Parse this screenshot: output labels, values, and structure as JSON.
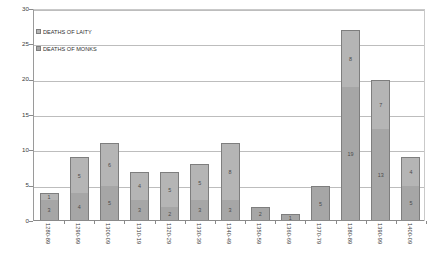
{
  "chart_data": {
    "type": "bar",
    "stacked": true,
    "title": "",
    "xlabel": "",
    "ylabel": "",
    "ylim": [
      0,
      30
    ],
    "ytick_step": 5,
    "yticks": [
      0,
      5,
      10,
      15,
      20,
      25,
      30
    ],
    "grid": true,
    "legend_position": "top-left",
    "categories": [
      "1280-89",
      "1290-99",
      "1300-09",
      "1310-19",
      "1320-29",
      "1330-39",
      "1340-49",
      "1350-59",
      "1360-69",
      "1370-79",
      "1380-89",
      "1390-99",
      "1400-09"
    ],
    "series": [
      {
        "name": "DEATHS OF MONKS",
        "color": "#a6a6a6",
        "values": [
          3,
          4,
          5,
          3,
          2,
          3,
          3,
          2,
          1,
          5,
          19,
          13,
          5
        ]
      },
      {
        "name": "DEATHS OF LAITY",
        "color": "#b5b5b5",
        "values": [
          1,
          5,
          6,
          4,
          5,
          5,
          8,
          0,
          0,
          0,
          8,
          7,
          4
        ]
      }
    ],
    "totals": [
      4,
      9,
      11,
      7,
      7,
      8,
      11,
      2,
      1,
      5,
      27,
      20,
      9
    ]
  },
  "legend": {
    "entries": [
      {
        "label": "DEATHS OF LAITY",
        "swatch": "laity"
      },
      {
        "label": "DEATHS OF MONKS",
        "swatch": "monks"
      }
    ]
  }
}
